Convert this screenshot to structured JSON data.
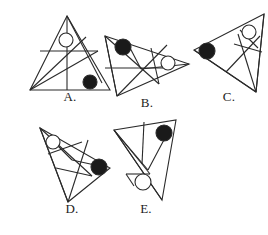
{
  "page": {
    "background_color": "#ffffff",
    "stroke_color": "#2a2a2a",
    "open_circle_fill": "#ffffff",
    "closed_circle_fill": "#1a1a1a",
    "label_color": "#1d1d1d"
  },
  "figures": [
    {
      "id": "figure-a",
      "label": "A.",
      "outline": "53,12 16,86 96,86",
      "inner_lines": [
        [
          53,
          12,
          53,
          86
        ],
        [
          26,
          47,
          84,
          47
        ],
        [
          16,
          86,
          72,
          33
        ],
        [
          16,
          86,
          84,
          47
        ],
        [
          53,
          12,
          88,
          79
        ]
      ],
      "markers": [
        {
          "name": "open-circle",
          "type": "open",
          "cx": 52,
          "cy": 36,
          "r": 7
        },
        {
          "name": "filled-circle",
          "type": "filled",
          "cx": 76,
          "cy": 78,
          "r": 7
        }
      ]
    },
    {
      "id": "figure-b",
      "label": "B.",
      "outline": "8,24 92,52 20,84",
      "inner_lines": [
        [
          8,
          24,
          20,
          84
        ],
        [
          8,
          24,
          62,
          72
        ],
        [
          20,
          84,
          70,
          33
        ],
        [
          8,
          56,
          66,
          56
        ],
        [
          54,
          36,
          62,
          72
        ],
        [
          44,
          57,
          92,
          52
        ],
        [
          32,
          34,
          44,
          57
        ]
      ],
      "markers": [
        {
          "name": "filled-circle",
          "type": "filled",
          "cx": 26,
          "cy": 35,
          "r": 8
        },
        {
          "name": "open-circle",
          "type": "open",
          "cx": 71,
          "cy": 51,
          "r": 7
        }
      ]
    },
    {
      "id": "figure-c",
      "label": "C.",
      "outline": "78,10 8,46 70,88",
      "inner_lines": [
        [
          78,
          10,
          70,
          88
        ],
        [
          8,
          46,
          70,
          88
        ],
        [
          40,
          68,
          74,
          32
        ],
        [
          52,
          30,
          70,
          88
        ],
        [
          48,
          40,
          76,
          48
        ],
        [
          54,
          26,
          72,
          44
        ]
      ],
      "markers": [
        {
          "name": "open-circle",
          "type": "open",
          "cx": 63,
          "cy": 28,
          "r": 7
        },
        {
          "name": "filled-circle",
          "type": "filled",
          "cx": 21,
          "cy": 47,
          "r": 8
        }
      ]
    },
    {
      "id": "figure-d",
      "label": "D.",
      "outline": "14,18 84,58 42,92",
      "inner_lines": [
        [
          14,
          18,
          42,
          92
        ],
        [
          14,
          18,
          66,
          66
        ],
        [
          42,
          92,
          62,
          30
        ],
        [
          22,
          44,
          56,
          32
        ],
        [
          26,
          30,
          46,
          50
        ],
        [
          46,
          50,
          78,
          57
        ],
        [
          30,
          58,
          66,
          66
        ]
      ],
      "markers": [
        {
          "name": "open-circle",
          "type": "open",
          "cx": 27,
          "cy": 32,
          "r": 7
        },
        {
          "name": "filled-circle",
          "type": "filled",
          "cx": 73,
          "cy": 57,
          "r": 8
        }
      ]
    },
    {
      "id": "figure-e",
      "label": "E.",
      "outline": "10,22 72,12 58,92",
      "inner_lines": [
        [
          10,
          22,
          58,
          92
        ],
        [
          10,
          22,
          44,
          62
        ],
        [
          44,
          62,
          62,
          28
        ],
        [
          40,
          14,
          38,
          56
        ],
        [
          10,
          22,
          38,
          56
        ],
        [
          22,
          66,
          46,
          66
        ],
        [
          46,
          66,
          38,
          56
        ],
        [
          22,
          66,
          30,
          78
        ]
      ],
      "markers": [
        {
          "name": "filled-circle",
          "type": "filled",
          "cx": 60,
          "cy": 25,
          "r": 8
        },
        {
          "name": "open-circle",
          "type": "open",
          "cx": 39,
          "cy": 74,
          "r": 8
        }
      ]
    }
  ],
  "layout": {
    "positions": [
      {
        "id": "figure-a",
        "left": 14,
        "top": 4,
        "width": 112,
        "height": 96,
        "label_top": 86
      },
      {
        "id": "figure-b",
        "left": 97,
        "top": 12,
        "width": 100,
        "height": 92,
        "label_top": 84
      },
      {
        "id": "figure-c",
        "left": 186,
        "top": 4,
        "width": 86,
        "height": 96,
        "label_top": 86
      },
      {
        "id": "figure-d",
        "left": 26,
        "top": 110,
        "width": 92,
        "height": 100,
        "label_top": 92
      },
      {
        "id": "figure-e",
        "left": 104,
        "top": 108,
        "width": 84,
        "height": 102,
        "label_top": 94
      }
    ]
  }
}
